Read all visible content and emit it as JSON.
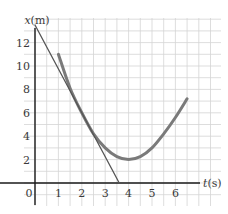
{
  "chart_data": {
    "type": "line",
    "title": "",
    "xlabel": "t(s)",
    "ylabel": "x(m)",
    "x_ticks": [
      "0",
      "1",
      "2",
      "3",
      "4",
      "5",
      "6"
    ],
    "y_ticks": [
      "2",
      "4",
      "6",
      "8",
      "10",
      "12"
    ],
    "xlim": [
      -0.4,
      7
    ],
    "ylim": [
      -1.5,
      15
    ],
    "grid": true,
    "grid_step": {
      "t": 0.5,
      "x": 1
    },
    "series": [
      {
        "name": "x(t) curve",
        "color": "#7a7a7a",
        "x": [
          1.0,
          1.5,
          2.0,
          2.5,
          3.0,
          3.5,
          4.0,
          4.5,
          5.0,
          5.5,
          6.0,
          6.5
        ],
        "values": [
          11.0,
          8.1,
          6.0,
          4.2,
          3.0,
          2.25,
          2.0,
          2.25,
          3.0,
          4.2,
          5.6,
          7.2
        ]
      },
      {
        "name": "tangent line at t=2",
        "color": "#555555",
        "x": [
          0.0,
          3.6
        ],
        "values": [
          13.5,
          0.0
        ]
      }
    ]
  },
  "colors": {
    "grid": "#d4d4d4",
    "axis": "#1a1a1a",
    "curve": "#7a7a7a",
    "tangent": "#555555",
    "text": "#3a3a3a"
  }
}
